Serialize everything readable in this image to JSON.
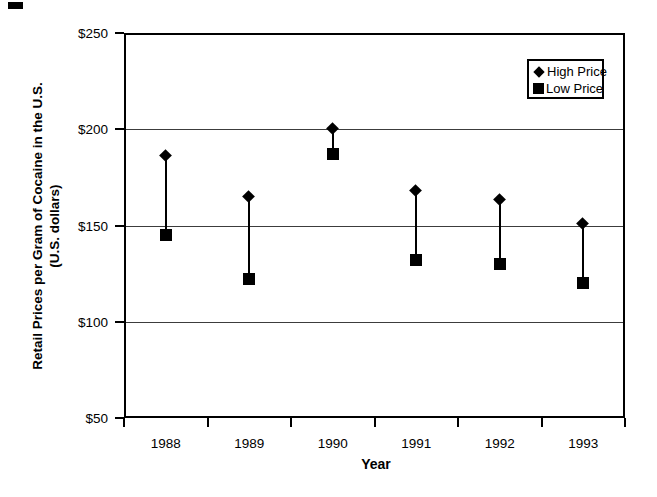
{
  "figure": {
    "background_color": "#ffffff",
    "foreground_color": "#000000",
    "note": "scanned black-and-white statistical figure with small scan speck in top-left corner"
  },
  "y_axis": {
    "title_line1": "Retail Prices per Gram of Cocaine in the U.S.",
    "title_line2": "(U.S. dollars)",
    "tick_labels": [
      "$250",
      "$200",
      "$150",
      "$100",
      "$50"
    ]
  },
  "x_axis": {
    "title": "Year",
    "tick_labels": [
      "1988",
      "1989",
      "1990",
      "1991",
      "1992",
      "1993"
    ]
  },
  "legend": {
    "items": [
      {
        "label": "High Price",
        "marker": "diamond"
      },
      {
        "label": "Low Price",
        "marker": "square"
      }
    ]
  },
  "chart_data": {
    "type": "scatter",
    "subtype": "high-low range chart (vertical line connects high and low marker per year)",
    "categories": [
      "1988",
      "1989",
      "1990",
      "1991",
      "1992",
      "1993"
    ],
    "series": [
      {
        "name": "High Price",
        "marker": "diamond",
        "values": [
          186,
          165,
          200,
          168,
          163,
          151
        ]
      },
      {
        "name": "Low Price",
        "marker": "square",
        "values": [
          145,
          122,
          187,
          132,
          130,
          120
        ]
      }
    ],
    "title": "",
    "xlabel": "Year",
    "ylabel": "Retail Prices per Gram of Cocaine in the U.S. (U.S. dollars)",
    "ylim": [
      50,
      250
    ],
    "ytick_interval": 50,
    "grid": "horizontal gridlines at $100, $150, $200; $250 and $50 form the plot frame",
    "legend_position": "upper-right inside plot area, boxed"
  }
}
